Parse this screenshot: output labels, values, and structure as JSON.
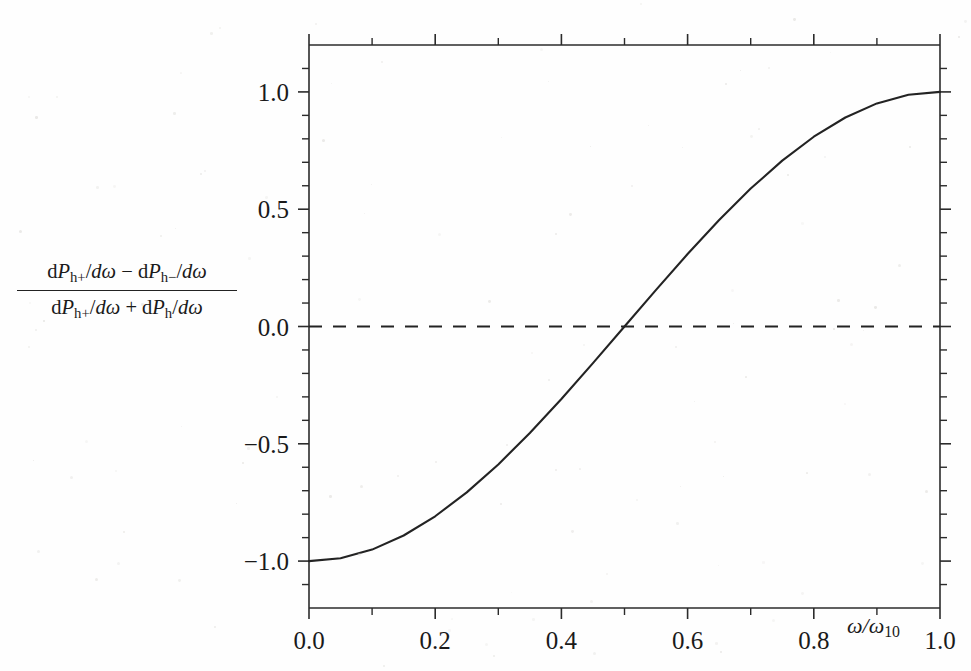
{
  "figure": {
    "background_color": "#fefefe",
    "ink_color": "#232323"
  },
  "axis_titles": {
    "y_numerator_prefix": "d",
    "y_numerator": "P",
    "x_title_main": "ω/ω",
    "x_title_sub": "10"
  },
  "y_axis_label": {
    "numerator": [
      {
        "kind": "up",
        "text": "d"
      },
      {
        "kind": "it",
        "text": "P"
      },
      {
        "kind": "sub",
        "text": "h+"
      },
      {
        "kind": "up",
        "text": "/"
      },
      {
        "kind": "it",
        "text": "dω"
      },
      {
        "kind": "up",
        "text": " − "
      },
      {
        "kind": "up",
        "text": "d"
      },
      {
        "kind": "it",
        "text": "P"
      },
      {
        "kind": "sub",
        "text": "h−"
      },
      {
        "kind": "up",
        "text": "/"
      },
      {
        "kind": "it",
        "text": "dω"
      }
    ],
    "denominator": [
      {
        "kind": "up",
        "text": "d"
      },
      {
        "kind": "it",
        "text": "P"
      },
      {
        "kind": "sub",
        "text": "h+"
      },
      {
        "kind": "up",
        "text": "/"
      },
      {
        "kind": "it",
        "text": "dω"
      },
      {
        "kind": "up",
        "text": " + "
      },
      {
        "kind": "up",
        "text": "d"
      },
      {
        "kind": "it",
        "text": "P"
      },
      {
        "kind": "sub",
        "text": "h"
      },
      {
        "kind": "up",
        "text": "/"
      },
      {
        "kind": "it",
        "text": "dω"
      }
    ]
  },
  "chart_data": {
    "type": "line",
    "title": "",
    "subtitle": "",
    "xlabel": "ω/ω₁₀",
    "ylabel": "(dP_h+/dω − dP_h−/dω) / (dP_h+/dω + dP_h/dω)",
    "xlim": [
      0.0,
      1.0
    ],
    "ylim": [
      -1.2,
      1.2
    ],
    "grid": false,
    "legend": false,
    "legend_position": "none",
    "x_tick_labels": [
      "0.0",
      "0.2",
      "0.4",
      "0.6",
      "0.8",
      "1.0"
    ],
    "x_ticks": [
      0.0,
      0.2,
      0.4,
      0.6,
      0.8,
      1.0
    ],
    "x_minor_tick_interval": 0.1,
    "y_tick_labels": [
      "1.0",
      "0.5",
      "0.0",
      "−0.5",
      "−1.0"
    ],
    "y_ticks": [
      1.0,
      0.5,
      0.0,
      -0.5,
      -1.0
    ],
    "y_minor_tick_interval": 0.1,
    "annotations": [
      {
        "name": "zero-reference-line",
        "style": "dashed",
        "y": 0.0,
        "x_from": 0.0,
        "x_to": 1.0
      }
    ],
    "series": [
      {
        "name": "polarization-asymmetry",
        "style": "solid",
        "description": "-cos(pi * x)",
        "x": [
          0.0,
          0.05,
          0.1,
          0.15,
          0.2,
          0.25,
          0.3,
          0.35,
          0.4,
          0.45,
          0.5,
          0.55,
          0.6,
          0.65,
          0.7,
          0.75,
          0.8,
          0.85,
          0.9,
          0.95,
          1.0
        ],
        "values": [
          -1.0,
          -0.988,
          -0.951,
          -0.891,
          -0.809,
          -0.707,
          -0.588,
          -0.454,
          -0.309,
          -0.156,
          0.0,
          0.156,
          0.309,
          0.454,
          0.588,
          0.707,
          0.809,
          0.891,
          0.951,
          0.988,
          1.0
        ]
      }
    ]
  }
}
